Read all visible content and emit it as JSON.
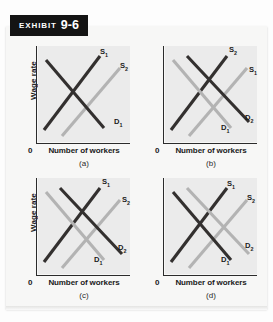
{
  "exhibit": {
    "word": "Exhibit",
    "number": "9-6"
  },
  "axes": {
    "ylabel": "Wage rate",
    "xlabel": "Number of workers",
    "origin": "0"
  },
  "panels": [
    {
      "caption": "(a)",
      "show_ylabel": true,
      "curves": [
        {
          "name": "S1",
          "label": "S",
          "sub": "1",
          "tone": "dark",
          "type": "supply",
          "label_x": 62,
          "label_y": 2
        },
        {
          "name": "S2",
          "label": "S",
          "sub": "2",
          "tone": "light",
          "type": "supply",
          "label_x": 82,
          "label_y": 16
        },
        {
          "name": "D1",
          "label": "D",
          "sub": "1",
          "tone": "dark",
          "type": "demand",
          "label_x": 76,
          "label_y": 72
        }
      ]
    },
    {
      "caption": "(b)",
      "show_ylabel": false,
      "curves": [
        {
          "name": "S2",
          "label": "S",
          "sub": "2",
          "tone": "dark",
          "type": "supply",
          "label_x": 64,
          "label_y": 0
        },
        {
          "name": "S1",
          "label": "S",
          "sub": "1",
          "tone": "light",
          "type": "supply",
          "label_x": 84,
          "label_y": 20
        },
        {
          "name": "D1",
          "label": "D",
          "sub": "1",
          "tone": "light",
          "type": "demand",
          "label_x": 56,
          "label_y": 78
        },
        {
          "name": "D2",
          "label": "D",
          "sub": "2",
          "tone": "dark",
          "type": "demand",
          "label_x": 80,
          "label_y": 68
        }
      ]
    },
    {
      "caption": "(c)",
      "show_ylabel": true,
      "curves": [
        {
          "name": "S1",
          "label": "S",
          "sub": "1",
          "tone": "dark",
          "type": "supply",
          "label_x": 64,
          "label_y": 0
        },
        {
          "name": "S2",
          "label": "S",
          "sub": "2",
          "tone": "light",
          "type": "supply",
          "label_x": 84,
          "label_y": 18
        },
        {
          "name": "D1",
          "label": "D",
          "sub": "1",
          "tone": "light",
          "type": "demand",
          "label_x": 56,
          "label_y": 78
        },
        {
          "name": "D2",
          "label": "D",
          "sub": "2",
          "tone": "dark",
          "type": "demand",
          "label_x": 80,
          "label_y": 66
        }
      ]
    },
    {
      "caption": "(d)",
      "show_ylabel": false,
      "curves": [
        {
          "name": "S1",
          "label": "S",
          "sub": "1",
          "tone": "dark",
          "type": "supply",
          "label_x": 62,
          "label_y": 2
        },
        {
          "name": "S2",
          "label": "S",
          "sub": "2",
          "tone": "light",
          "type": "supply",
          "label_x": 82,
          "label_y": 16
        },
        {
          "name": "D1",
          "label": "D",
          "sub": "1",
          "tone": "dark",
          "type": "demand",
          "label_x": 56,
          "label_y": 78
        },
        {
          "name": "D2",
          "label": "D",
          "sub": "2",
          "tone": "light",
          "type": "demand",
          "label_x": 80,
          "label_y": 64
        }
      ]
    }
  ],
  "geometry": {
    "supply_left": {
      "x1": 6,
      "y1": 84,
      "x2": 62,
      "y2": 10
    },
    "supply_right": {
      "x1": 24,
      "y1": 90,
      "x2": 82,
      "y2": 22
    },
    "demand_left": {
      "x1": 8,
      "y1": 14,
      "x2": 66,
      "y2": 82
    },
    "demand_right": {
      "x1": 22,
      "y1": 10,
      "x2": 84,
      "y2": 76
    }
  },
  "colors": {
    "dark_curve": "#33302f",
    "light_curve": "#b3b3b3",
    "plot_background": "#ebebeb",
    "banner_background": "#141414",
    "page_background": "#f7f7f6"
  }
}
